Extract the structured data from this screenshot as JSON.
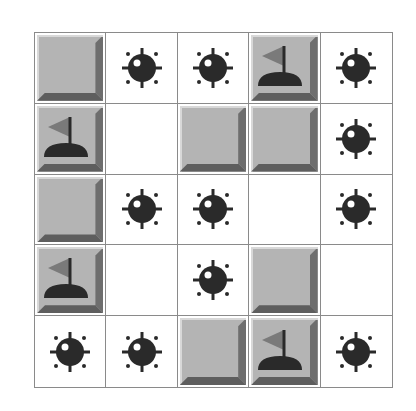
{
  "game": "Minesweeper",
  "board": {
    "rows": 5,
    "cols": 5,
    "cells": [
      [
        "covered",
        "mine",
        "mine",
        "flag",
        "mine"
      ],
      [
        "flag",
        "empty",
        "covered",
        "covered",
        "mine"
      ],
      [
        "covered",
        "mine",
        "mine",
        "empty",
        "mine"
      ],
      [
        "flag",
        "empty",
        "mine",
        "covered",
        "empty"
      ],
      [
        "mine",
        "mine",
        "covered",
        "flag",
        "mine"
      ]
    ]
  },
  "icons": {
    "mine": "mine-icon",
    "flag": "flag-icon"
  },
  "colors": {
    "covered_tile": "#b4b4b4",
    "bevel_dark": "#5e5e5e",
    "mine": "#2a2a2a",
    "flag": "#7a7a7a",
    "grid_line": "#8a8a8a"
  }
}
